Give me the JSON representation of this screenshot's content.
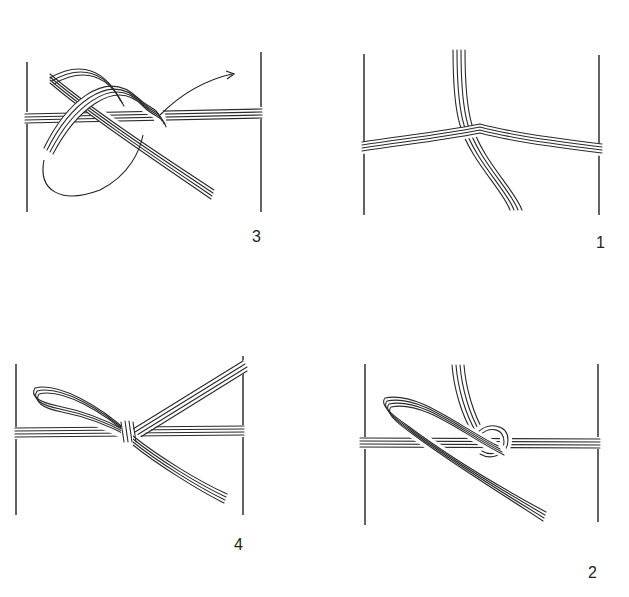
{
  "figure": {
    "steps": [
      {
        "id": "step-1",
        "label": "1",
        "position": "top-right",
        "caption": "Cords cross over the horizontal band"
      },
      {
        "id": "step-2",
        "label": "2",
        "position": "bottom-right",
        "caption": "A loop is formed and passed under"
      },
      {
        "id": "step-3",
        "label": "3",
        "position": "top-left",
        "caption": "Loop drawn through, arrow indicates pulling direction"
      },
      {
        "id": "step-4",
        "label": "4",
        "position": "bottom-left",
        "caption": "Finished bow knot"
      }
    ],
    "colors": {
      "ink": "#2a2a2a",
      "background": "#ffffff"
    }
  }
}
